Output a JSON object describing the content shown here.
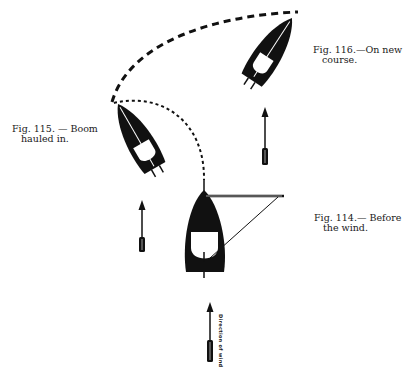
{
  "figures": [
    {
      "id": "fig-116",
      "line1": "Fig. 116.—On new",
      "line2": "course."
    },
    {
      "id": "fig-115",
      "line1": "Fig. 115. — Boom",
      "line2": "hauled in."
    },
    {
      "id": "fig-114",
      "line1": "Fig. 114.— Before",
      "line2": "the wind."
    }
  ],
  "wind_label": "Direction of wind",
  "colors": {
    "ink": "#111111",
    "paper": "#ffffff"
  }
}
